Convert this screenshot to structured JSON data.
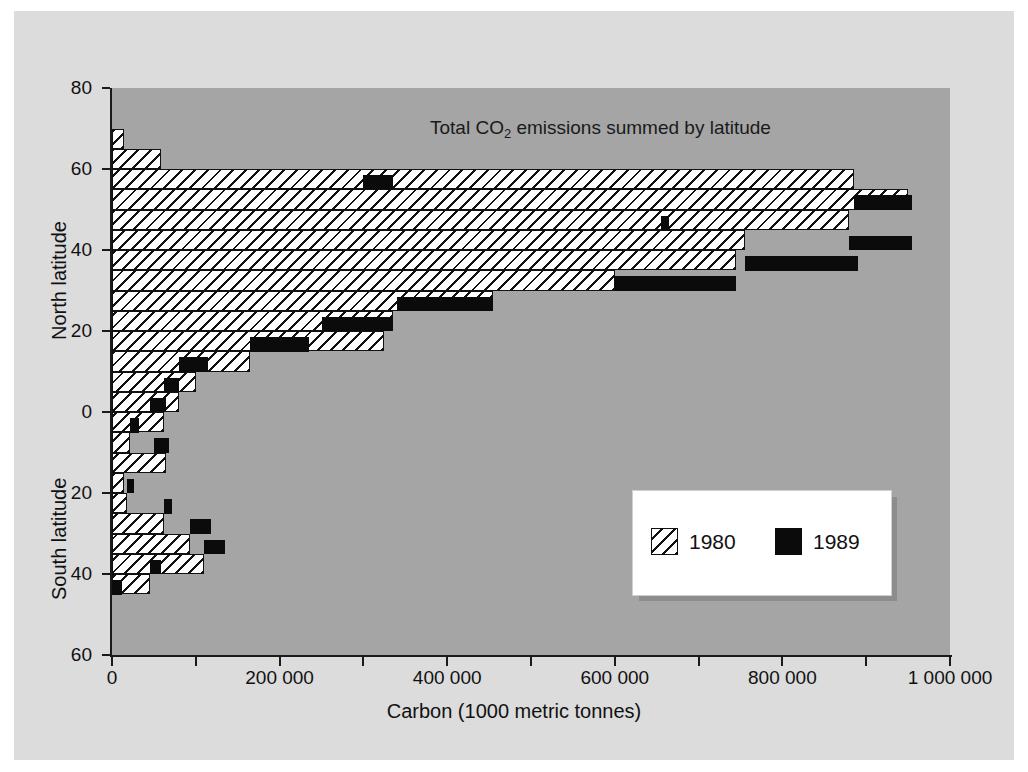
{
  "figure": {
    "title_prefix": "Total CO",
    "title_sub": "2",
    "title_suffix": " emissions summed by latitude",
    "title_full": "Total CO2 emissions summed by latitude",
    "panel_color": "#dcdcdc",
    "plot_color": "#a5a5a5"
  },
  "axes": {
    "y_title_north": "North latitude",
    "y_title_south": "South latitude",
    "x_title": "Carbon (1000 metric tonnes)",
    "y_tick_labels": [
      "80",
      "60",
      "40",
      "20",
      "0",
      "20",
      "40",
      "60"
    ],
    "x_tick_labels": [
      "0",
      "200 000",
      "400 000",
      "600 000",
      "800 000",
      "1 000 000"
    ]
  },
  "legend": {
    "entries": [
      {
        "label": "1980",
        "swatch": "hatch",
        "color": "#ffffff"
      },
      {
        "label": "1989",
        "swatch": "solid",
        "color": "#0b0b0b"
      }
    ]
  },
  "chart_data": {
    "type": "bar",
    "orientation": "horizontal",
    "title": "Total CO2 emissions summed by latitude",
    "xlabel": "Carbon (1000 metric tonnes)",
    "ylabel": "Latitude (North / South)",
    "xlim": [
      0,
      1000000
    ],
    "ylim": [
      -60,
      80
    ],
    "grid": false,
    "legend_position": "lower-right",
    "x_ticks": [
      0,
      100000,
      200000,
      300000,
      400000,
      500000,
      600000,
      700000,
      800000,
      900000,
      1000000
    ],
    "x_tick_labels_shown": [
      0,
      200000,
      400000,
      600000,
      800000,
      1000000
    ],
    "y_ticks": [
      80,
      60,
      40,
      20,
      0,
      -20,
      -40,
      -60
    ],
    "y_tick_labels_shown": [
      "80",
      "60",
      "40",
      "20",
      "0",
      "20",
      "40",
      "60"
    ],
    "band_width_degrees": 5,
    "categories": [
      "70N-65N",
      "65N-60N",
      "60N-55N",
      "55N-50N",
      "50N-45N",
      "45N-40N",
      "40N-35N",
      "35N-30N",
      "30N-25N",
      "25N-20N",
      "20N-15N",
      "15N-10N",
      "10N-5N",
      "5N-0",
      "0-5S",
      "5S-10S",
      "10S-15S",
      "15S-20S",
      "20S-25S",
      "25S-30S",
      "30S-35S",
      "35S-40S",
      "40S-45S"
    ],
    "band_top_latitude": [
      70,
      65,
      60,
      55,
      50,
      45,
      40,
      35,
      30,
      25,
      20,
      15,
      10,
      5,
      0,
      -5,
      -10,
      -15,
      -20,
      -25,
      -30,
      -35,
      -40
    ],
    "series": [
      {
        "name": "1980",
        "color": "#ffffff",
        "pattern": "diagonal-hatch",
        "values": [
          14000,
          58000,
          885000,
          950000,
          880000,
          755000,
          745000,
          600000,
          455000,
          335000,
          325000,
          165000,
          100000,
          80000,
          62000,
          22000,
          65000,
          14000,
          18000,
          62000,
          93000,
          110000,
          45000
        ]
      },
      {
        "name": "1989",
        "color": "#0b0b0b",
        "pattern": "solid",
        "values": [
          0,
          0,
          0,
          0,
          0,
          0,
          0,
          0,
          0,
          0,
          0,
          0,
          0,
          0,
          0,
          0,
          0,
          0,
          0,
          0,
          0,
          0,
          0
        ]
      }
    ],
    "series_1989_extension": {
      "note": "1989 drawn as black block extending beyond/at the 1980 bar end",
      "segments": [
        {
          "band": "65N-60N",
          "start": 0,
          "end": 0
        },
        {
          "band": "60N-55N",
          "start": 300000,
          "end": 335000
        },
        {
          "band": "55N-50N",
          "start": 885000,
          "end": 955000
        },
        {
          "band": "50N-45N",
          "start": 655000,
          "end": 665000
        },
        {
          "band": "45N-40N",
          "start": 880000,
          "end": 955000
        },
        {
          "band": "40N-35N",
          "start": 755000,
          "end": 890000
        },
        {
          "band": "35N-30N",
          "start": 600000,
          "end": 745000
        },
        {
          "band": "30N-25N",
          "start": 340000,
          "end": 455000
        },
        {
          "band": "25N-20N",
          "start": 250000,
          "end": 335000
        },
        {
          "band": "20N-15N",
          "start": 165000,
          "end": 235000
        },
        {
          "band": "15N-10N",
          "start": 80000,
          "end": 115000
        },
        {
          "band": "10N-5N",
          "start": 62000,
          "end": 80000
        },
        {
          "band": "5N-0",
          "start": 45000,
          "end": 65000
        },
        {
          "band": "0-5S",
          "start": 22000,
          "end": 32000
        },
        {
          "band": "5S-10S",
          "start": 50000,
          "end": 68000
        },
        {
          "band": "15S-20S",
          "start": 18000,
          "end": 26000
        },
        {
          "band": "20S-25S",
          "start": 62000,
          "end": 72000
        },
        {
          "band": "25S-30S",
          "start": 93000,
          "end": 118000
        },
        {
          "band": "30S-35S",
          "start": 110000,
          "end": 135000
        },
        {
          "band": "35S-40S",
          "start": 45000,
          "end": 58000
        },
        {
          "band": "40S-45S",
          "start": 0,
          "end": 12000
        }
      ]
    }
  }
}
